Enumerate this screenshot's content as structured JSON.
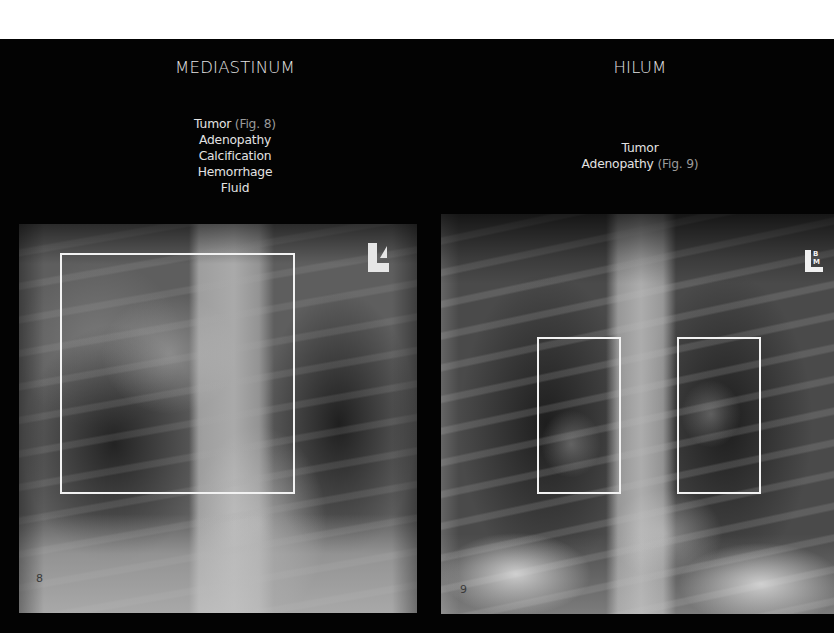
{
  "sections": [
    {
      "heading": "MEDIASTINUM",
      "findings": [
        {
          "text": "Tumor",
          "ref": "(Fig. 8)"
        },
        {
          "text": "Adenopathy",
          "ref": ""
        },
        {
          "text": "Calcification",
          "ref": ""
        },
        {
          "text": "Hemorrhage",
          "ref": ""
        },
        {
          "text": "Fluid",
          "ref": ""
        }
      ],
      "figure": {
        "number": "8",
        "marker": "L",
        "description": "Frontal chest radiograph with rectangle outlining the mediastinum"
      }
    },
    {
      "heading": "HILUM",
      "findings": [
        {
          "text": "Tumor",
          "ref": ""
        },
        {
          "text": "Adenopathy",
          "ref": "(Fig. 9)"
        }
      ],
      "figure": {
        "number": "9",
        "marker": "L",
        "marker_letters": [
          "B",
          "M"
        ],
        "description": "Frontal chest radiograph with rectangles outlining both hila"
      }
    }
  ],
  "colors": {
    "background": "#000000",
    "heading_text": "#e4e4e4",
    "reference_text": "#9a9a9a",
    "roi_outline": "#f2f2f2"
  }
}
